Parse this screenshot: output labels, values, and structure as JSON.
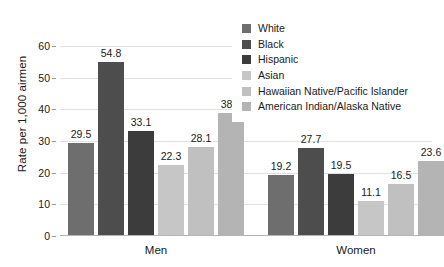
{
  "chart_data": {
    "type": "bar",
    "title": "",
    "subtitle": "",
    "xlabel": "",
    "ylabel": "Rate per 1,000 airmen",
    "categories": [
      "Men",
      "Women"
    ],
    "ylim": [
      0,
      60
    ],
    "yticks": [
      0,
      10,
      20,
      30,
      40,
      50,
      60
    ],
    "ytick_labels": [
      "0",
      "10",
      "20",
      "30",
      "40",
      "50",
      "60"
    ],
    "grid": true,
    "grid_axis": "y",
    "legend_position": "top-right",
    "data_labels": true,
    "series": [
      {
        "name": "White",
        "color": "#6e6e6e",
        "values": [
          29.5,
          19.2
        ],
        "labels": [
          "29.5",
          "19.2"
        ]
      },
      {
        "name": "Black",
        "color": "#4d4d4d",
        "values": [
          54.8,
          27.7
        ],
        "labels": [
          "54.8",
          "27.7"
        ]
      },
      {
        "name": "Hispanic",
        "color": "#3c3c3c",
        "values": [
          33.1,
          19.5
        ],
        "labels": [
          "33.1",
          "19.5"
        ]
      },
      {
        "name": "Asian",
        "color": "#c6c6c6",
        "values": [
          22.3,
          11.1
        ],
        "labels": [
          "22.3",
          "11.1"
        ]
      },
      {
        "name": "Hawaiian Native/Pacific Islander",
        "color": "#c0c0c0",
        "values": [
          28.1,
          16.5
        ],
        "labels": [
          "28.1",
          "16.5"
        ]
      },
      {
        "name": "American Indian/Alaska Native",
        "color": "#b4b4b4",
        "values": [
          38.7,
          23.6
        ],
        "labels": [
          "38.7",
          "23.6"
        ]
      }
    ]
  },
  "axis": {
    "y_title": "Rate per 1,000 airmen"
  },
  "legend": {
    "items": [
      {
        "label": "White",
        "color": "#6e6e6e"
      },
      {
        "label": "Black",
        "color": "#4d4d4d"
      },
      {
        "label": "Hispanic",
        "color": "#3c3c3c"
      },
      {
        "label": "Asian",
        "color": "#c6c6c6"
      },
      {
        "label": "Hawaiian Native/Pacific Islander",
        "color": "#c0c0c0"
      },
      {
        "label": "American Indian/Alaska Native",
        "color": "#b4b4b4"
      }
    ]
  },
  "colors": {
    "gridline": "#e2e2e2",
    "axis": "#b4b4b4",
    "text": "#1a1a1a",
    "background": "#ffffff"
  }
}
